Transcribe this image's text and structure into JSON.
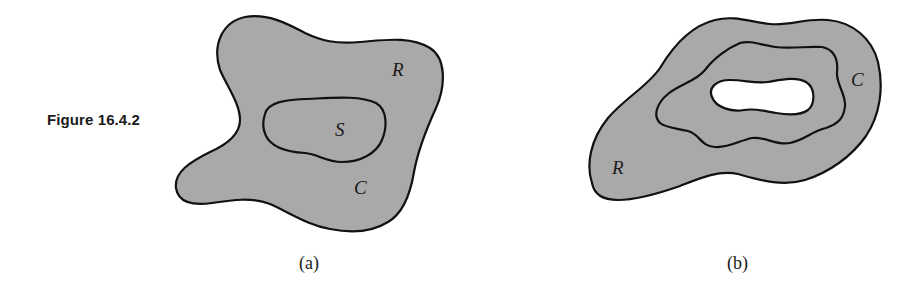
{
  "figure": {
    "label": "Figure 16.4.2",
    "panels": [
      {
        "caption": "(a)",
        "labels": {
          "region": "R",
          "inner_region": "S",
          "curve": "C"
        }
      },
      {
        "caption": "(b)",
        "labels": {
          "region": "R",
          "curve": "C"
        }
      }
    ],
    "colors": {
      "fill": "#a9a9a9",
      "stroke": "#111111",
      "hole": "#ffffff"
    }
  }
}
